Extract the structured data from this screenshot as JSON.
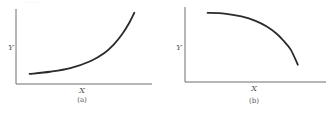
{
  "top_fragment_text": "………",
  "chart_data": [
    {
      "type": "line",
      "panel": "(a)",
      "title": "",
      "xlabel": "X",
      "ylabel": "Y",
      "caption": "(a)",
      "grid": false,
      "ticks": false,
      "description": "convex increasing (exponential-like) curve",
      "xlim": [
        0,
        1
      ],
      "ylim": [
        0,
        1
      ],
      "x": [
        0.1,
        0.25,
        0.4,
        0.55,
        0.65,
        0.72,
        0.78,
        0.83,
        0.87
      ],
      "y": [
        0.14,
        0.17,
        0.22,
        0.32,
        0.43,
        0.55,
        0.69,
        0.84,
        0.99
      ],
      "color": "#2a2a2a"
    },
    {
      "type": "line",
      "panel": "(b)",
      "title": "",
      "xlabel": "X",
      "ylabel": "Y",
      "caption": "(b)",
      "grid": false,
      "ticks": false,
      "description": "concave decreasing curve",
      "xlim": [
        0,
        1
      ],
      "ylim": [
        0,
        1
      ],
      "x": [
        0.16,
        0.28,
        0.4,
        0.5,
        0.58,
        0.65,
        0.7,
        0.75,
        0.8
      ],
      "y": [
        0.96,
        0.95,
        0.91,
        0.85,
        0.77,
        0.67,
        0.57,
        0.45,
        0.24
      ],
      "color": "#2a2a2a"
    }
  ]
}
